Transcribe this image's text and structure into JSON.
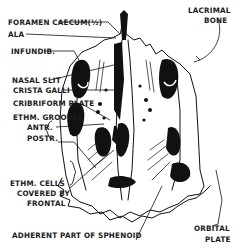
{
  "figure": {
    "ink_color": "#111111",
    "background": "#ffffff"
  },
  "labels": {
    "foramen_caecum": "FORAMEN CAECUM(½)",
    "ala": "ALA",
    "infundib": "INFUNDIB.",
    "nasal_slit": "NASAL SLIT",
    "crista_galli": "CRISTA GALLI",
    "cribriform_plate": "CRIBRIFORM PLATE",
    "ethm_grooves": "ETHM. GROOVES",
    "antr": "ANTR.",
    "postr": "POSTR.",
    "ethm_cells_1": "ETHM. CELLS",
    "ethm_cells_2": "COVERED BY",
    "ethm_cells_3": "FRONTAL",
    "adherent_sphenoid": "ADHERENT PART OF SPHENOID",
    "lacrimal_1": "LACRIMAL",
    "lacrimal_2": "BONE",
    "orbital_1": "ORBITAL",
    "orbital_2": "PLATE"
  }
}
